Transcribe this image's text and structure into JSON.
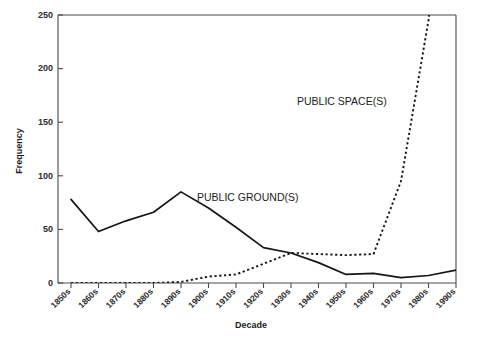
{
  "chart_data": {
    "type": "line",
    "title": "",
    "xlabel": "Decade",
    "ylabel": "Frequency",
    "categories": [
      "1850s",
      "1860s",
      "1870s",
      "1880s",
      "1890s",
      "1900s",
      "1910s",
      "1920s",
      "1930s",
      "1940s",
      "1950s",
      "1960s",
      "1970s",
      "1980s",
      "1990s"
    ],
    "ylim": [
      0,
      250
    ],
    "yticks": [
      0,
      50,
      100,
      150,
      200,
      250
    ],
    "ytick_labels": [
      "0",
      "50",
      "100",
      "150",
      "200",
      "250"
    ],
    "grid": false,
    "legend_position": "inline-annotation",
    "series": [
      {
        "name": "PUBLIC GROUND(S)",
        "style": "solid",
        "values": [
          78,
          48,
          58,
          66,
          85,
          70,
          52,
          33,
          28,
          19,
          8,
          9,
          5,
          7,
          12
        ]
      },
      {
        "name": "PUBLIC SPACE(S)",
        "style": "dotted",
        "values": [
          0,
          0,
          0,
          0,
          1,
          6,
          8,
          18,
          28,
          27,
          26,
          27,
          95,
          245,
          460
        ]
      }
    ],
    "annotations": [
      {
        "text": "PUBLIC GROUND(S)",
        "x_px": 197,
        "y_px": 197
      },
      {
        "text": "PUBLIC SPACE(S)",
        "x_px": 297,
        "y_px": 101
      }
    ]
  },
  "axis": {
    "y_title": "Frequency",
    "x_title": "Decade",
    "y_tick_0": "0",
    "y_tick_1": "50",
    "y_tick_2": "100",
    "y_tick_3": "150",
    "y_tick_4": "200",
    "y_tick_5": "250"
  },
  "xlabels": {
    "t0": "1850s",
    "t1": "1860s",
    "t2": "1870s",
    "t3": "1880s",
    "t4": "1890s",
    "t5": "1900s",
    "t6": "1910s",
    "t7": "1920s",
    "t8": "1930s",
    "t9": "1940s",
    "t10": "1950s",
    "t11": "1960s",
    "t12": "1970s",
    "t13": "1980s",
    "t14": "1990s"
  },
  "labels": {
    "ground": "PUBLIC GROUND(S)",
    "space": "PUBLIC SPACE(S)"
  },
  "colors": {
    "line": "#151515",
    "axis": "#4a4a4a",
    "text": "#1c1c1c",
    "background": "#ffffff"
  }
}
